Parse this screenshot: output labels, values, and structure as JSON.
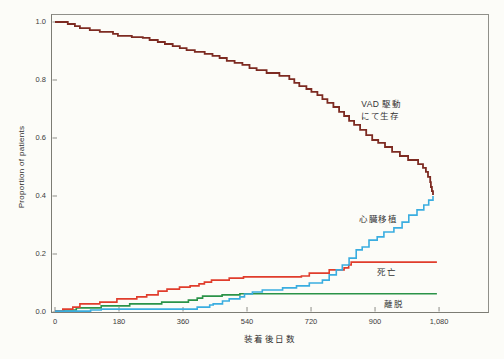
{
  "chart_data": {
    "type": "line",
    "subtype": "step-survival-curves",
    "title": "",
    "xlabel": "装着後日数",
    "ylabel": "Proportion of patients",
    "xlim": [
      0,
      1220
    ],
    "ylim": [
      0,
      1.0
    ],
    "grid": false,
    "frame": true,
    "legend_position": "inline-annotations",
    "x_ticks": {
      "values": [
        0,
        180,
        360,
        540,
        720,
        900,
        1080
      ],
      "labels": [
        "0",
        "180",
        "360",
        "540",
        "720",
        "900",
        "1,080"
      ]
    },
    "y_ticks": {
      "values": [
        0,
        0.2,
        0.4,
        0.6,
        0.8,
        1.0
      ],
      "labels": [
        "0.0",
        "0.2",
        "0.4",
        "0.6",
        "0.8",
        "1.0"
      ]
    },
    "series": [
      {
        "name": "vad-survival",
        "label": "VAD 駆動にて生存",
        "color": "#7d2b22",
        "points": [
          [
            0,
            1.0
          ],
          [
            36,
            0.993
          ],
          [
            56,
            0.986
          ],
          [
            70,
            0.979
          ],
          [
            98,
            0.972
          ],
          [
            126,
            0.966
          ],
          [
            163,
            0.959
          ],
          [
            177,
            0.952
          ],
          [
            216,
            0.948
          ],
          [
            247,
            0.945
          ],
          [
            266,
            0.938
          ],
          [
            289,
            0.931
          ],
          [
            309,
            0.924
          ],
          [
            331,
            0.917
          ],
          [
            351,
            0.91
          ],
          [
            370,
            0.903
          ],
          [
            393,
            0.897
          ],
          [
            421,
            0.89
          ],
          [
            443,
            0.883
          ],
          [
            463,
            0.876
          ],
          [
            483,
            0.866
          ],
          [
            505,
            0.859
          ],
          [
            527,
            0.852
          ],
          [
            547,
            0.841
          ],
          [
            567,
            0.834
          ],
          [
            595,
            0.824
          ],
          [
            631,
            0.814
          ],
          [
            659,
            0.803
          ],
          [
            673,
            0.79
          ],
          [
            687,
            0.779
          ],
          [
            707,
            0.769
          ],
          [
            721,
            0.759
          ],
          [
            738,
            0.748
          ],
          [
            752,
            0.734
          ],
          [
            766,
            0.721
          ],
          [
            783,
            0.707
          ],
          [
            799,
            0.69
          ],
          [
            813,
            0.676
          ],
          [
            827,
            0.659
          ],
          [
            841,
            0.645
          ],
          [
            858,
            0.628
          ],
          [
            875,
            0.61
          ],
          [
            892,
            0.593
          ],
          [
            909,
            0.583
          ],
          [
            928,
            0.569
          ],
          [
            948,
            0.552
          ],
          [
            970,
            0.538
          ],
          [
            993,
            0.524
          ],
          [
            1021,
            0.51
          ],
          [
            1035,
            0.497
          ],
          [
            1043,
            0.483
          ],
          [
            1049,
            0.466
          ],
          [
            1055,
            0.448
          ],
          [
            1057,
            0.431
          ],
          [
            1060,
            0.417
          ],
          [
            1063,
            0.403
          ]
        ]
      },
      {
        "name": "heart-transplant",
        "label": "心臓移植",
        "color": "#3aade0",
        "points": [
          [
            0,
            0.003
          ],
          [
            100,
            0.007
          ],
          [
            130,
            0.01
          ],
          [
            400,
            0.017
          ],
          [
            435,
            0.024
          ],
          [
            445,
            0.028
          ],
          [
            471,
            0.038
          ],
          [
            490,
            0.045
          ],
          [
            520,
            0.052
          ],
          [
            533,
            0.062
          ],
          [
            555,
            0.069
          ],
          [
            583,
            0.076
          ],
          [
            640,
            0.083
          ],
          [
            679,
            0.09
          ],
          [
            715,
            0.1
          ],
          [
            752,
            0.11
          ],
          [
            771,
            0.128
          ],
          [
            791,
            0.145
          ],
          [
            808,
            0.162
          ],
          [
            827,
            0.186
          ],
          [
            847,
            0.214
          ],
          [
            864,
            0.224
          ],
          [
            883,
            0.248
          ],
          [
            906,
            0.259
          ],
          [
            925,
            0.276
          ],
          [
            953,
            0.29
          ],
          [
            976,
            0.31
          ],
          [
            995,
            0.334
          ],
          [
            1018,
            0.352
          ],
          [
            1037,
            0.369
          ],
          [
            1051,
            0.386
          ],
          [
            1063,
            0.4
          ]
        ]
      },
      {
        "name": "death",
        "label": "死亡",
        "color": "#e03d2c",
        "points": [
          [
            0,
            0.003
          ],
          [
            22,
            0.01
          ],
          [
            50,
            0.017
          ],
          [
            70,
            0.028
          ],
          [
            126,
            0.034
          ],
          [
            174,
            0.045
          ],
          [
            230,
            0.052
          ],
          [
            258,
            0.059
          ],
          [
            290,
            0.072
          ],
          [
            315,
            0.079
          ],
          [
            350,
            0.086
          ],
          [
            380,
            0.09
          ],
          [
            405,
            0.097
          ],
          [
            420,
            0.103
          ],
          [
            440,
            0.11
          ],
          [
            490,
            0.117
          ],
          [
            530,
            0.121
          ],
          [
            693,
            0.124
          ],
          [
            715,
            0.134
          ],
          [
            771,
            0.145
          ],
          [
            813,
            0.152
          ],
          [
            826,
            0.162
          ],
          [
            833,
            0.172
          ],
          [
            1074,
            0.172
          ]
        ]
      },
      {
        "name": "weaning",
        "label": "離脱",
        "color": "#2b9348",
        "points": [
          [
            0,
            0.003
          ],
          [
            25,
            0.007
          ],
          [
            60,
            0.014
          ],
          [
            130,
            0.021
          ],
          [
            210,
            0.028
          ],
          [
            300,
            0.034
          ],
          [
            375,
            0.041
          ],
          [
            400,
            0.048
          ],
          [
            415,
            0.055
          ],
          [
            470,
            0.059
          ],
          [
            520,
            0.063
          ],
          [
            1074,
            0.063
          ]
        ]
      }
    ],
    "annotations": [
      {
        "name": "vad-survival-label",
        "text": "VAD 駆動\nにて生存",
        "day": 861,
        "prop": 0.734
      },
      {
        "name": "heart-transplant-label",
        "text": "心臓移植",
        "day": 856,
        "prop": 0.338
      },
      {
        "name": "death-label",
        "text": "死亡",
        "day": 906,
        "prop": 0.155
      },
      {
        "name": "weaning-label",
        "text": "離脱",
        "day": 926,
        "prop": 0.045
      }
    ]
  },
  "colors": {
    "background": "#fcfcf8",
    "frame": "#8d8d87",
    "tick_text": "#3b3b3b",
    "annotation_text": "#333333",
    "vad_survival": "#7d2b22",
    "heart_transplant": "#3aade0",
    "death": "#e03d2c",
    "weaning": "#2b9348"
  }
}
